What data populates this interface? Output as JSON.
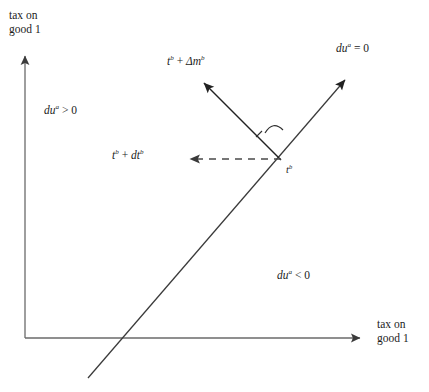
{
  "figure": {
    "width": 429,
    "height": 392,
    "background": "#ffffff",
    "line_color": "#2b2b2b",
    "axis_color": "#5a5a5a"
  },
  "axes": {
    "y": {
      "title_line1": "tax on",
      "title_line2": "good 1",
      "origin": {
        "x": 25,
        "y": 338
      },
      "tip": {
        "x": 25,
        "y": 48
      }
    },
    "x": {
      "title_line1": "tax on",
      "title_line2": "good 1",
      "origin": {
        "x": 25,
        "y": 338
      },
      "tip": {
        "x": 370,
        "y": 338
      }
    }
  },
  "locus": {
    "label": "du",
    "label_sup": "a",
    "label_op": " = ",
    "label_value": "0",
    "start": {
      "x": 88,
      "y": 378
    },
    "tip": {
      "x": 353,
      "y": 72
    }
  },
  "regions": [
    {
      "name": "above-locus",
      "label": "du",
      "label_sup": "a",
      "label_op": " > ",
      "label_value": "0"
    },
    {
      "name": "below-locus",
      "label": "du",
      "label_sup": "a",
      "label_op": " < ",
      "label_value": "0"
    }
  ],
  "point": {
    "label": "t",
    "label_sup": "b",
    "x": 281,
    "y": 160
  },
  "vectors": [
    {
      "name": "lump-sum-transfer",
      "style": "solid",
      "text_1": "t",
      "sup_1": "b",
      "op": " + ",
      "text_2": "Δm",
      "sup_2": "b",
      "from": {
        "x": 281,
        "y": 160
      },
      "to": {
        "x": 197,
        "y": 76
      }
    },
    {
      "name": "tax-change",
      "style": "dashed",
      "text_1": "t",
      "sup_1": "b",
      "op": " + ",
      "text_2": "dt",
      "sup_2": "b",
      "from": {
        "x": 281,
        "y": 159
      },
      "to": {
        "x": 182,
        "y": 159
      }
    }
  ],
  "angle_marker": {
    "name": "right-angle-arc",
    "x": 272,
    "y": 126
  }
}
